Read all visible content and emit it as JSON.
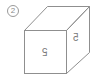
{
  "figure": {
    "label": "2",
    "front_face_glyph": "5",
    "right_face_glyph": "5",
    "line_color": "#8f8f8f"
  }
}
